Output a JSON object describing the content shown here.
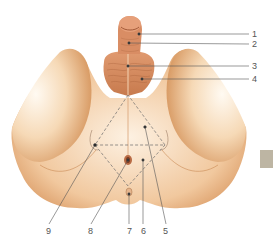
{
  "figure": {
    "colors": {
      "skin_light": "#fbe9d2",
      "skin_mid": "#e9b583",
      "skin_dark": "#c98a55",
      "muscle": "#d68d62",
      "leader_line": "#555555",
      "dashed_line": "#6b6b6b",
      "side_tab": "#bdb5a3"
    },
    "labels_right": [
      {
        "id": "1",
        "text": "1",
        "x": 252,
        "y": 30
      },
      {
        "id": "2",
        "text": "2",
        "x": 252,
        "y": 40
      },
      {
        "id": "3",
        "text": "3",
        "x": 252,
        "y": 62
      },
      {
        "id": "4",
        "text": "4",
        "x": 252,
        "y": 75
      }
    ],
    "labels_bottom": [
      {
        "id": "9",
        "text": "9",
        "x": 46,
        "y": 227
      },
      {
        "id": "8",
        "text": "8",
        "x": 88,
        "y": 227
      },
      {
        "id": "7",
        "text": "7",
        "x": 127,
        "y": 227
      },
      {
        "id": "6",
        "text": "6",
        "x": 141,
        "y": 227
      },
      {
        "id": "5",
        "text": "5",
        "x": 163,
        "y": 227
      }
    ],
    "triangles": {
      "urogenital": {
        "apex": [
          128,
          95
        ],
        "left": [
          95,
          145
        ],
        "right": [
          165,
          145
        ]
      },
      "anal": {
        "left": [
          95,
          145
        ],
        "right": [
          165,
          145
        ],
        "bottom": [
          128,
          186
        ]
      }
    }
  }
}
